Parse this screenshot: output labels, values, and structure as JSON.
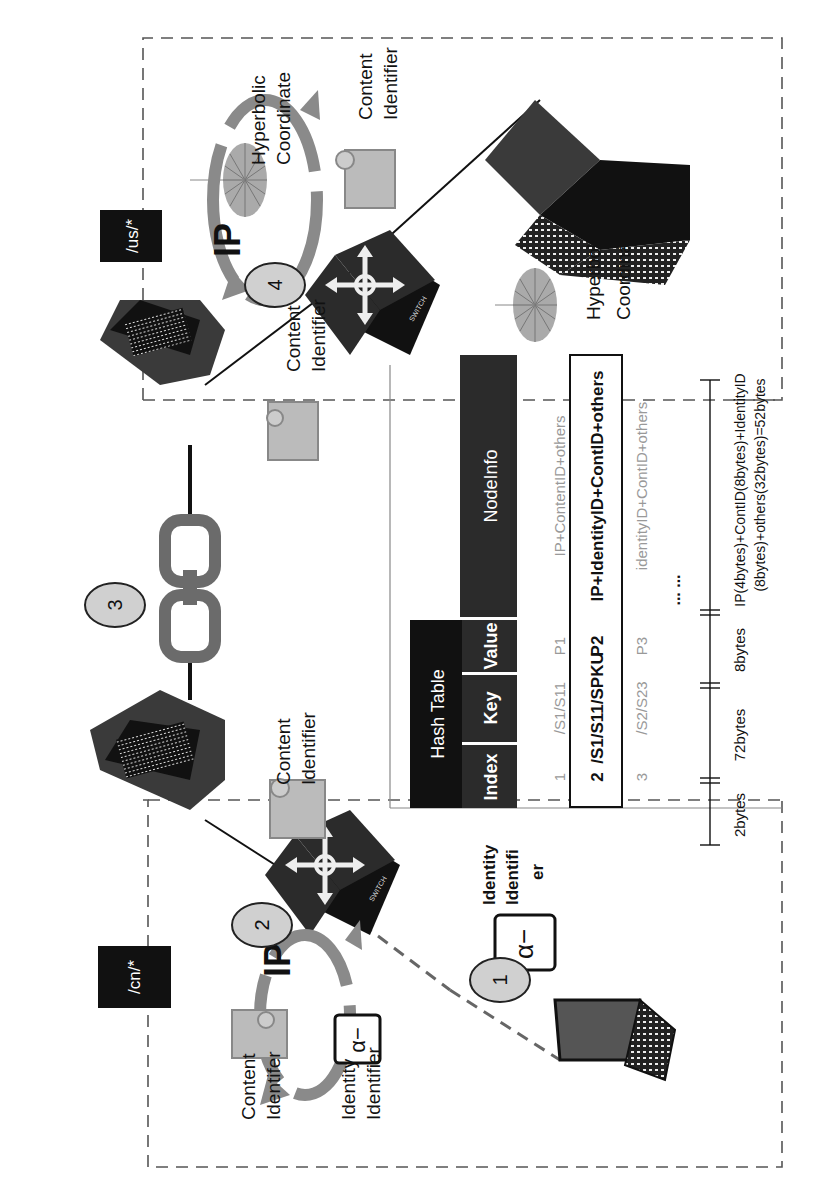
{
  "regions": {
    "us": {
      "label": "/us/*"
    },
    "cn": {
      "label": "/cn/*"
    }
  },
  "steps": [
    {
      "number": "1"
    },
    {
      "number": "2"
    },
    {
      "number": "3"
    },
    {
      "number": "4"
    }
  ],
  "labels": {
    "hyperbolic_coordinate_top": [
      "Hyperbolic",
      "Coordinate"
    ],
    "content_identifier_top": [
      "Content",
      "Identifier"
    ],
    "content_identifier_switch4": [
      "Content",
      "Identifier"
    ],
    "hyperbolic_coordinate_right": [
      "Hyperbolic",
      "Coordinate"
    ],
    "content_identifier_server1": [
      "Content",
      "Identifier"
    ],
    "content_identifier_cn": [
      "Content",
      "Identifer"
    ],
    "identity_identifier_cn": [
      "Identity",
      "Identifier"
    ],
    "identity_identifier_user": [
      "Identity",
      "Identifi",
      "er"
    ],
    "ip_logo": "IP",
    "switch_label": "SWITCH"
  },
  "hash_table": {
    "title": "Hash Table",
    "columns": [
      "Index",
      "Key",
      "Value",
      "NodeInfo"
    ],
    "rows": [
      {
        "index": "1",
        "key": "/S1/S11",
        "value": "P1",
        "nodeinfo": "IP+ContentID+others",
        "highlight": false
      },
      {
        "index": "2",
        "key": "/S1/S11/SPKU",
        "value": "P2",
        "nodeinfo": "IP+IdentityID+ContID+others",
        "highlight": true
      },
      {
        "index": "3",
        "key": "/S2/S23",
        "value": "P3",
        "nodeinfo": "identityID+ContID+others",
        "highlight": false
      }
    ],
    "ellipsis": "... ..."
  },
  "sizes": {
    "index": "2bytes",
    "key": "72bytes",
    "value": "8bytes",
    "nodeinfo_line1": "IP(4bytes)+ContID(8bytes)+IdentityID",
    "nodeinfo_line2": "(8bytes)+others(32bytes)=52bytes"
  },
  "colors": {
    "black": "#111111",
    "dark": "#2b2b2b",
    "mid": "#6b6b6b",
    "light": "#c8c8c8",
    "step_fill": "#d0d0d0",
    "dash": "#555555"
  }
}
